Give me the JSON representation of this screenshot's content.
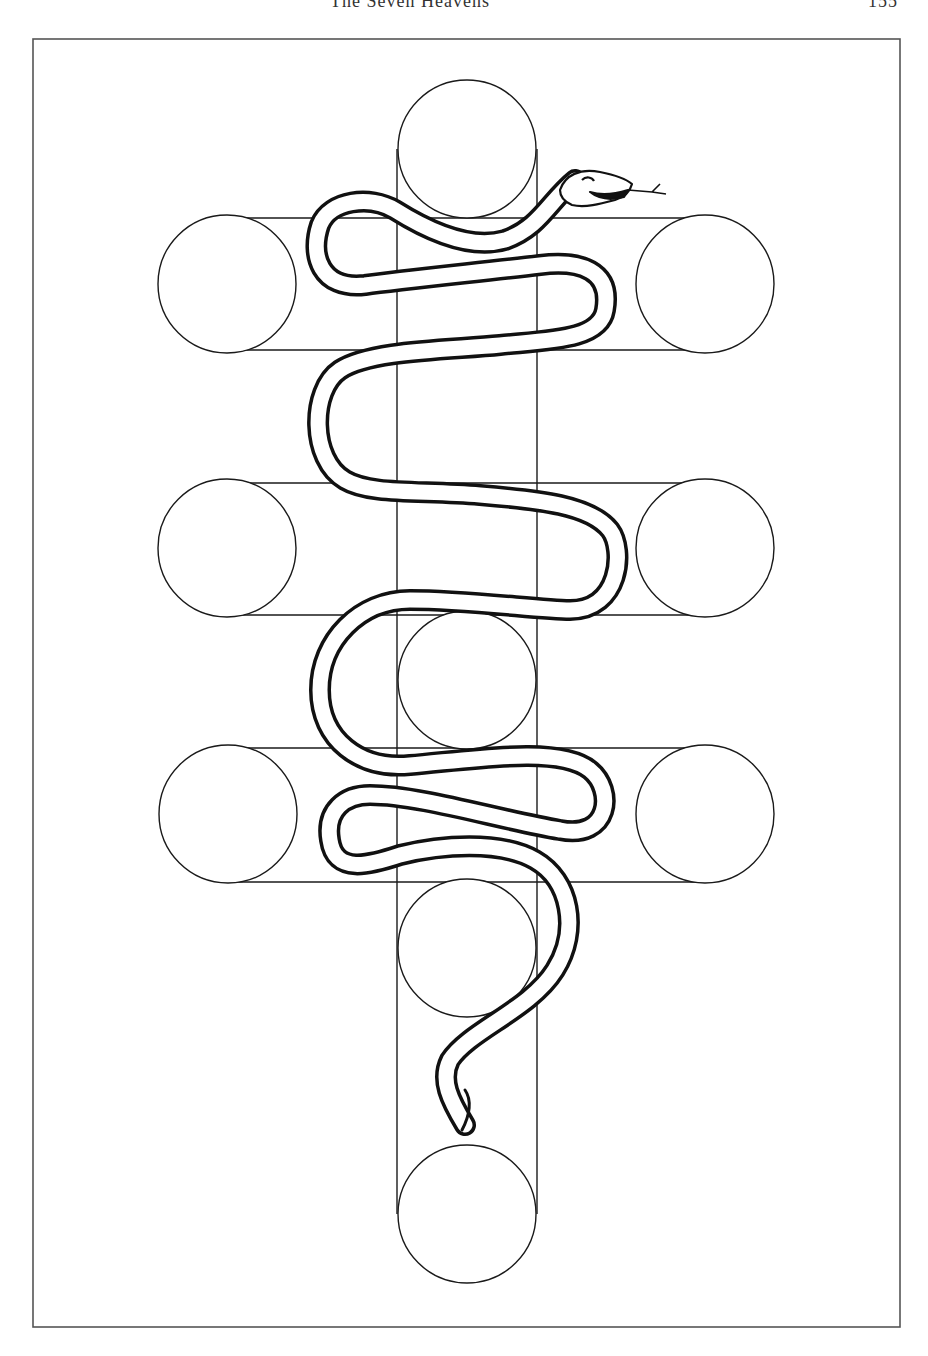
{
  "page": {
    "running_head": "The Seven Heavens",
    "page_number": "155"
  },
  "figure": {
    "stroke_color": "#1a1a1a",
    "frame_color": "#555555",
    "background": "#ffffff",
    "circle_radius": 69,
    "circles": [
      {
        "id": "top-center",
        "cx": 467,
        "cy": 149
      },
      {
        "id": "row1-left",
        "cx": 227,
        "cy": 284
      },
      {
        "id": "row1-right",
        "cx": 705,
        "cy": 284
      },
      {
        "id": "row2-left",
        "cx": 227,
        "cy": 548
      },
      {
        "id": "row2-right",
        "cx": 705,
        "cy": 548
      },
      {
        "id": "center",
        "cx": 467,
        "cy": 680
      },
      {
        "id": "row3-left",
        "cx": 228,
        "cy": 814
      },
      {
        "id": "row3-right",
        "cx": 705,
        "cy": 814
      },
      {
        "id": "lower-center",
        "cx": 467,
        "cy": 948
      },
      {
        "id": "bottom-center",
        "cx": 467,
        "cy": 1214
      }
    ],
    "serpent": {
      "head_position": "upper-right near top circle",
      "tail_position": "below lower-center circle",
      "tongue": "forked"
    }
  }
}
